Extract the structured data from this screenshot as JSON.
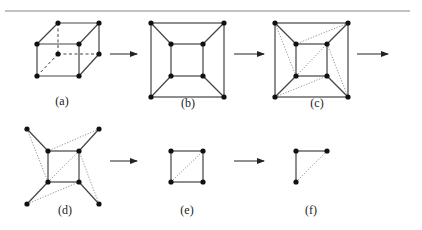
{
  "figure": {
    "panels": [
      {
        "id": "a",
        "label": "(a)",
        "description": "3D cube graph with hidden (dashed) edges"
      },
      {
        "id": "b",
        "label": "(b)",
        "description": "Planar embedding of cube: outer square, inner square, spokes"
      },
      {
        "id": "c",
        "label": "(c)",
        "description": "Cube embedding with dotted diagonal edges added"
      },
      {
        "id": "d",
        "label": "(d)",
        "description": "Inner square with outer vertices detached, dotted triangulation edges"
      },
      {
        "id": "e",
        "label": "(e)",
        "description": "Square with one dotted diagonal"
      },
      {
        "id": "f",
        "label": "(f)",
        "description": "Three vertices: two solid edges and one dotted edge"
      }
    ],
    "arrows": [
      {
        "from": "a",
        "to": "b"
      },
      {
        "from": "b",
        "to": "c"
      },
      {
        "from": "c",
        "to": "d"
      },
      {
        "from": "d",
        "to": "e"
      },
      {
        "from": "e",
        "to": "f"
      }
    ]
  }
}
